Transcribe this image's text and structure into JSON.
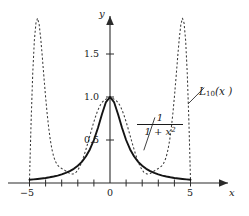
{
  "figure": {
    "title_caption": "",
    "background": "#ffffff",
    "axes": {
      "x_axis_label": "x",
      "y_axis_label": "y",
      "x_tick_labels": [
        "−5",
        "0",
        "5"
      ],
      "y_tick_labels": [
        "0.5",
        "1.0",
        "1.5"
      ]
    },
    "annotations": {
      "interpolant_label": "L",
      "interpolant_subscript": "10",
      "interpolant_arg": "(x )",
      "runge_numerator": "1",
      "runge_denominator_base": "1 + x",
      "runge_denominator_exp": "2"
    },
    "colors": {
      "axis": "#2b2b2b",
      "solid_curve": "#141414",
      "dashed_curve": "#3a3a3a",
      "text": "#1a1a1a"
    }
  },
  "chart_data": {
    "type": "line",
    "title": "",
    "subtitle": "",
    "xlabel": "x",
    "ylabel": "y",
    "xlim": [
      -6.8,
      8.6
    ],
    "ylim": [
      -0.45,
      2.2
    ],
    "grid": false,
    "legend": "inline-annotations",
    "x_ticks": [
      -5,
      -4,
      -3,
      -2,
      -1,
      0,
      1,
      2,
      3,
      4,
      5
    ],
    "x_tick_labels_shown": {
      "-5": "−5",
      "0": "0",
      "5": "5"
    },
    "y_ticks": [
      0.5,
      1.0,
      1.5
    ],
    "y_tick_labels_shown": {
      "0.5": "0.5",
      "1.0": "1.0",
      "1.5": "1.5"
    },
    "annotations": [
      {
        "text": "L10(x )",
        "x": 6.1,
        "y": 1.12,
        "leader_to_x": 4.85,
        "leader_to_y": 0.92
      },
      {
        "text": "1/(1 + x^2)",
        "x": 2.85,
        "y": 0.74,
        "leader_to_x": 2.1,
        "leader_to_y": 0.38
      }
    ],
    "series": [
      {
        "name": "1/(1 + x^2)",
        "style": "solid",
        "formula": "f(x) = 1/(1 + x^2)",
        "x": [
          -5.0,
          -4.75,
          -4.5,
          -4.25,
          -4.0,
          -3.75,
          -3.5,
          -3.25,
          -3.0,
          -2.75,
          -2.5,
          -2.25,
          -2.0,
          -1.75,
          -1.5,
          -1.25,
          -1.0,
          -0.75,
          -0.5,
          -0.25,
          0.0,
          0.25,
          0.5,
          0.75,
          1.0,
          1.25,
          1.5,
          1.75,
          2.0,
          2.25,
          2.5,
          2.75,
          3.0,
          3.25,
          3.5,
          3.75,
          4.0,
          4.25,
          4.5,
          4.75,
          5.0
        ],
        "y": [
          0.0385,
          0.0424,
          0.0471,
          0.0525,
          0.0588,
          0.0664,
          0.0755,
          0.0865,
          0.1,
          0.1169,
          0.1379,
          0.1649,
          0.2,
          0.2462,
          0.3077,
          0.3902,
          0.5,
          0.64,
          0.8,
          0.9412,
          1.0,
          0.9412,
          0.8,
          0.64,
          0.5,
          0.3902,
          0.3077,
          0.2462,
          0.2,
          0.1649,
          0.1379,
          0.1169,
          0.1,
          0.0865,
          0.0755,
          0.0664,
          0.0588,
          0.0525,
          0.0471,
          0.0424,
          0.0385
        ]
      },
      {
        "name": "L10(x )",
        "style": "dashed",
        "formula": "degree-10 Lagrange interpolant of 1/(1+x^2) on 11 equispaced nodes in [-5,5]",
        "nodes_x": [
          -5,
          -4,
          -3,
          -2,
          -1,
          0,
          1,
          2,
          3,
          4,
          5
        ],
        "nodes_y": [
          0.0385,
          0.0588,
          0.1,
          0.2,
          0.5,
          1.0,
          0.5,
          0.2,
          0.1,
          0.0588,
          0.0385
        ],
        "x": [
          -5.0,
          -4.9,
          -4.8,
          -4.7,
          -4.6,
          -4.5,
          -4.4,
          -4.3,
          -4.2,
          -4.1,
          -4.0,
          -3.9,
          -3.8,
          -3.7,
          -3.6,
          -3.5,
          -3.4,
          -3.3,
          -3.2,
          -3.1,
          -3.0,
          -2.9,
          -2.8,
          -2.7,
          -2.6,
          -2.5,
          -2.4,
          -2.3,
          -2.2,
          -2.1,
          -2.0,
          -1.9,
          -1.8,
          -1.7,
          -1.6,
          -1.5,
          -1.4,
          -1.3,
          -1.2,
          -1.1,
          -1.0,
          -0.9,
          -0.8,
          -0.7,
          -0.6,
          -0.5,
          -0.4,
          -0.3,
          -0.2,
          -0.1,
          0.0,
          0.1,
          0.2,
          0.3,
          0.4,
          0.5,
          0.6,
          0.7,
          0.8,
          0.9,
          1.0,
          1.1,
          1.2,
          1.3,
          1.4,
          1.5,
          1.6,
          1.7,
          1.8,
          1.9,
          2.0,
          2.1,
          2.2,
          2.3,
          2.4,
          2.5,
          2.6,
          2.7,
          2.8,
          2.9,
          3.0,
          3.1,
          3.2,
          3.3,
          3.4,
          3.5,
          3.6,
          3.7,
          3.8,
          3.9,
          4.0,
          4.1,
          4.2,
          4.3,
          4.4,
          4.5,
          4.6,
          4.7,
          4.8,
          4.9,
          5.0
        ],
        "y": [
          0.0385,
          0.7163,
          1.2692,
          1.6538,
          1.8596,
          1.9159,
          1.8428,
          1.6758,
          1.4563,
          1.2235,
          1.0,
          0.7994,
          0.6293,
          0.4917,
          0.3861,
          0.3088,
          0.2551,
          0.2192,
          0.1962,
          0.1809,
          0.1693,
          0.1584,
          0.1467,
          0.1341,
          0.1217,
          0.1113,
          0.1049,
          0.1045,
          0.1114,
          0.1265,
          0.1504,
          0.1829,
          0.2237,
          0.2718,
          0.3266,
          0.3866,
          0.4504,
          0.5165,
          0.5834,
          0.6493,
          0.7124,
          0.7709,
          0.8235,
          0.8689,
          0.9062,
          0.9349,
          0.9554,
          0.9693,
          0.9791,
          0.9876,
          1.0,
          0.9876,
          0.9791,
          0.9693,
          0.9554,
          0.9349,
          0.9062,
          0.8689,
          0.8235,
          0.7709,
          0.7124,
          0.6493,
          0.5834,
          0.5165,
          0.4504,
          0.3866,
          0.3266,
          0.2718,
          0.2237,
          0.1829,
          0.1504,
          0.1265,
          0.1114,
          0.1045,
          0.1049,
          0.1113,
          0.1217,
          0.1341,
          0.1467,
          0.1584,
          0.1693,
          0.1809,
          0.1962,
          0.2192,
          0.2551,
          0.3088,
          0.3861,
          0.4917,
          0.6293,
          0.7994,
          1.0,
          1.2235,
          1.4563,
          1.6758,
          1.8428,
          1.9159,
          1.8596,
          1.6538,
          1.2692,
          0.7163,
          0.0385
        ]
      }
    ]
  }
}
